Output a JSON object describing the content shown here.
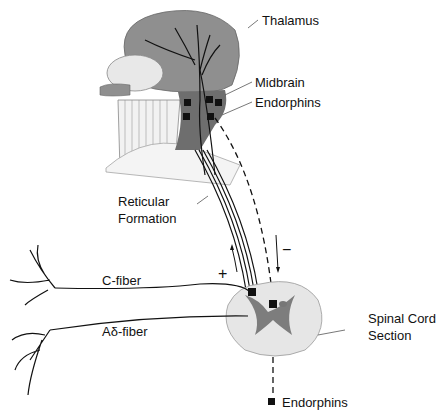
{
  "labels": {
    "thalamus": "Thalamus",
    "midbrain": "Midbrain",
    "endorphins_top": "Endorphins",
    "reticular_1": "Reticular",
    "reticular_2": "Formation",
    "c_fiber": "C-fiber",
    "a_delta_fiber": "Aδ-fiber",
    "plus": "+",
    "minus": "−",
    "spinal_1": "Spinal Cord",
    "spinal_2": "Section",
    "endorphins_bottom": "Endorphins"
  },
  "colors": {
    "brain": "#8f8f8f",
    "brainstem": "#6e6e6e",
    "cord_light": "#e6e6e6",
    "cord_gray": "#7d7d7d",
    "line": "#111111"
  }
}
